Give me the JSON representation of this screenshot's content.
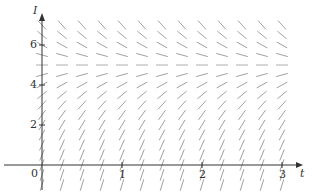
{
  "chart_data": {
    "type": "slope_field",
    "title": "",
    "xlabel": "t",
    "ylabel": "I",
    "x_ticks": [
      1,
      2,
      3
    ],
    "y_ticks": [
      2,
      4,
      6
    ],
    "origin_label": "0",
    "xlim": [
      -0.1,
      3.1
    ],
    "ylim": [
      -1.5,
      7.5
    ],
    "equilibrium": 5,
    "grid_t_step": 0.25,
    "grid_I_step": 0.5,
    "t_values": [
      0,
      0.25,
      0.5,
      0.75,
      1,
      1.25,
      1.5,
      1.75,
      2,
      2.25,
      2.5,
      2.75,
      3
    ],
    "I_values": [
      -1,
      -0.5,
      0,
      0.5,
      1,
      1.5,
      2,
      2.5,
      3,
      3.5,
      4,
      4.5,
      5,
      5.5,
      6,
      6.5,
      7
    ]
  },
  "labels": {
    "x_axis": "t",
    "y_axis": "I",
    "origin": "0",
    "x_tick_1": "1",
    "x_tick_2": "2",
    "x_tick_3": "3",
    "y_tick_2": "2",
    "y_tick_4": "4",
    "y_tick_6": "6"
  },
  "colors": {
    "axis": "#333333",
    "segment": "#888888",
    "equilibrium_segment": "#999999"
  }
}
